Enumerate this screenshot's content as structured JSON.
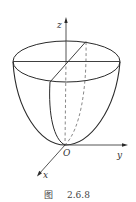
{
  "figure": {
    "caption_prefix": "图",
    "caption_number": "2.6.8"
  },
  "axes": {
    "z_label": "z",
    "y_label": "y",
    "x_label": "x",
    "origin_label": "O"
  },
  "colors": {
    "stroke": "#2a2a2a",
    "dashed": "#555555",
    "background": "#ffffff"
  }
}
